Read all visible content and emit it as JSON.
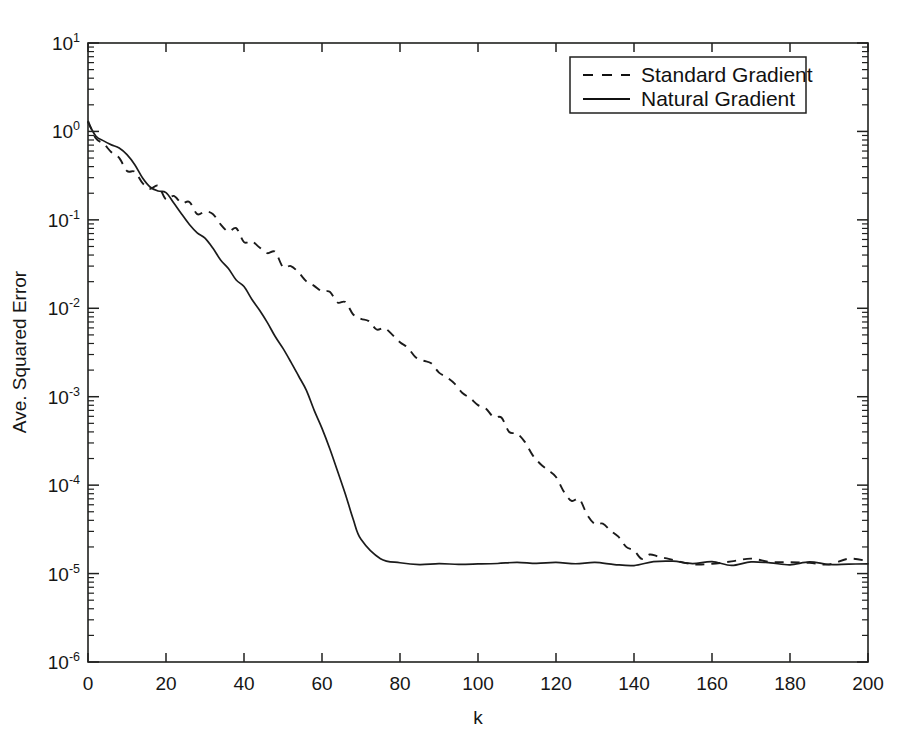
{
  "chart_data": {
    "type": "line",
    "title": "",
    "xlabel": "k",
    "ylabel": "Ave. Squared Error",
    "xlim": [
      0,
      200
    ],
    "ylim": [
      1e-06,
      10
    ],
    "yscale": "log",
    "grid": false,
    "legend_position": "top-right",
    "xticks": [
      0,
      20,
      40,
      60,
      80,
      100,
      120,
      140,
      160,
      180,
      200
    ],
    "xtick_labels": [
      "0",
      "20",
      "40",
      "60",
      "80",
      "100",
      "120",
      "140",
      "160",
      "180",
      "200"
    ],
    "yticks": [
      10,
      1,
      0.1,
      0.01,
      0.001,
      0.0001,
      1e-05,
      1e-06
    ],
    "ytick_labels": [
      "10^1",
      "10^0",
      "10^-1",
      "10^-2",
      "10^-3",
      "10^-4",
      "10^-5",
      "10^-6"
    ],
    "ytick_mantissa": [
      "10",
      "10",
      "10",
      "10",
      "10",
      "10",
      "10",
      "10"
    ],
    "ytick_exponent": [
      "1",
      "0",
      "-1",
      "-2",
      "-3",
      "-4",
      "-5",
      "-6"
    ],
    "series": [
      {
        "name": "Standard Gradient",
        "style": "dashed",
        "color": "#1b1b1b",
        "x": [
          0,
          2,
          4,
          6,
          8,
          10,
          12,
          14,
          16,
          18,
          20,
          22,
          24,
          26,
          28,
          30,
          32,
          34,
          36,
          38,
          40,
          42,
          44,
          46,
          48,
          50,
          52,
          54,
          56,
          58,
          60,
          62,
          64,
          66,
          68,
          70,
          72,
          74,
          76,
          78,
          80,
          82,
          84,
          86,
          88,
          90,
          92,
          94,
          96,
          98,
          100,
          102,
          104,
          106,
          108,
          110,
          112,
          114,
          116,
          118,
          120,
          122,
          124,
          126,
          128,
          130,
          132,
          134,
          136,
          138,
          140,
          142,
          144,
          146,
          148,
          150,
          155,
          160,
          165,
          170,
          175,
          180,
          185,
          190,
          195,
          200
        ],
        "y": [
          1.15,
          0.95,
          0.78,
          0.62,
          0.5,
          0.4,
          0.33,
          0.28,
          0.245,
          0.215,
          0.19,
          0.175,
          0.16,
          0.145,
          0.128,
          0.115,
          0.104,
          0.094,
          0.082,
          0.072,
          0.064,
          0.057,
          0.05,
          0.044,
          0.038,
          0.033,
          0.029,
          0.0255,
          0.0222,
          0.0195,
          0.017,
          0.0148,
          0.0129,
          0.0112,
          0.0097,
          0.0084,
          0.0073,
          0.0063,
          0.0055,
          0.0047,
          0.0041,
          0.0035,
          0.003,
          0.0026,
          0.00225,
          0.00193,
          0.00165,
          0.00141,
          0.0012,
          0.00102,
          0.00086,
          0.00073,
          0.00061,
          0.00051,
          0.00042,
          0.00035,
          0.00029,
          0.00023,
          0.000185,
          0.000148,
          0.000118,
          9.45e-05,
          7.56e-05,
          6.12e-05,
          4.98e-05,
          4.1e-05,
          3.4e-05,
          2.86e-05,
          2.44e-05,
          2.12e-05,
          1.86e-05,
          1.66e-05,
          1.52e-05,
          1.43e-05,
          1.38e-05,
          1.34e-05,
          1.32e-05,
          1.31e-05,
          1.3e-05,
          1.32e-05,
          1.29e-05,
          1.31e-05,
          1.3e-05,
          1.32e-05,
          1.29e-05,
          1.31e-05
        ]
      },
      {
        "name": "Natural Gradient",
        "style": "solid",
        "color": "#1b1b1b",
        "x": [
          0,
          2,
          4,
          6,
          8,
          10,
          12,
          14,
          16,
          18,
          20,
          22,
          24,
          26,
          28,
          30,
          32,
          34,
          36,
          38,
          40,
          42,
          44,
          46,
          48,
          50,
          52,
          54,
          56,
          58,
          60,
          62,
          64,
          66,
          68,
          70,
          75,
          80,
          85,
          90,
          95,
          100,
          105,
          110,
          115,
          120,
          125,
          130,
          135,
          140,
          145,
          150,
          155,
          160,
          165,
          170,
          175,
          180,
          185,
          190,
          195,
          200
        ],
        "y": [
          1.2,
          0.92,
          0.8,
          0.72,
          0.63,
          0.52,
          0.4,
          0.31,
          0.245,
          0.215,
          0.195,
          0.155,
          0.115,
          0.088,
          0.074,
          0.064,
          0.05,
          0.037,
          0.027,
          0.021,
          0.0175,
          0.0132,
          0.0094,
          0.0066,
          0.0047,
          0.0035,
          0.00255,
          0.00175,
          0.00115,
          0.00072,
          0.00044,
          0.00026,
          0.000145,
          7.55e-05,
          4e-05,
          2.32e-05,
          1.55e-05,
          1.37e-05,
          1.31e-05,
          1.33e-05,
          1.29e-05,
          1.32e-05,
          1.3e-05,
          1.33e-05,
          1.29e-05,
          1.31e-05,
          1.34e-05,
          1.3e-05,
          1.32e-05,
          1.28e-05,
          1.31e-05,
          1.33e-05,
          1.29e-05,
          1.32e-05,
          1.3e-05,
          1.33e-05,
          1.29e-05,
          1.31e-05,
          1.34e-05,
          1.3e-05,
          1.32e-05,
          1.3e-05
        ]
      }
    ]
  },
  "legend": {
    "entries": [
      {
        "label": "Standard Gradient",
        "style": "dashed"
      },
      {
        "label": "Natural Gradient",
        "style": "solid"
      }
    ]
  },
  "colors": {
    "ink": "#1b1b1b",
    "background": "#ffffff"
  }
}
